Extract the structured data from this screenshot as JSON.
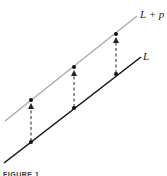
{
  "diagram": {
    "labels": {
      "translated_line": "L + p",
      "line": "L"
    },
    "caption": "FIGURE 1",
    "colors": {
      "line": "#111111",
      "translated_line": "#a8a8a8",
      "arrows": "#222222"
    },
    "points_on_L": 3,
    "arrows": 3
  }
}
